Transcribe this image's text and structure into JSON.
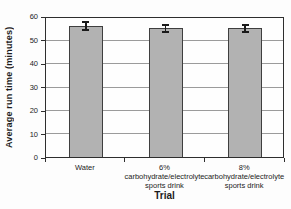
{
  "figure": {
    "background": "#fdfdfd"
  },
  "chart_data": {
    "type": "bar",
    "title": "",
    "xlabel": "Trial",
    "ylabel": "Average run time (minutes)",
    "categories": [
      "Water",
      "6%\ncarbohydrate/electrolyte\nsports drink",
      "8%\ncarbohydrate/electrolyte\nsports drink"
    ],
    "values": [
      56.5,
      55.5,
      55.5
    ],
    "error_bars": [
      2,
      1.8,
      1.8
    ],
    "ylim": [
      0,
      60
    ],
    "yticks": [
      0,
      10,
      20,
      30,
      40,
      50,
      60
    ],
    "grid": "horizontal",
    "legend_position": "none",
    "colors": {
      "bar_fill": "#b2b2b2",
      "bar_border": "#3f3f3f",
      "error_bar": "#1a1a1a",
      "gridline": "#9b9b9b",
      "axis": "#2e2e2e",
      "text": "#1c1c1c"
    }
  }
}
